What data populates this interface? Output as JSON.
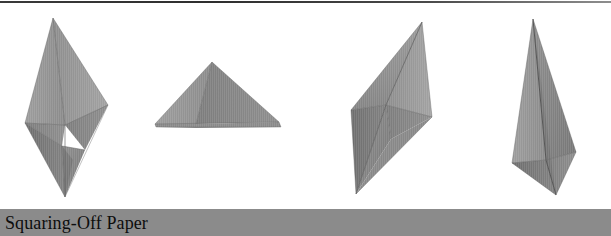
{
  "page": {
    "width": 611,
    "height": 236,
    "background_color": "#ffffff"
  },
  "top_rule": {
    "name": "top-rule",
    "color": "#2e2e2e"
  },
  "caption": {
    "text": "Squaring-Off Paper",
    "bar_color": "#8b8b8b",
    "text_color": "#0d0d0d"
  },
  "figures": {
    "label": "origami squaring-off paper sequence",
    "paper_colors": {
      "light": "#a7a7a7",
      "mid": "#949494",
      "dark": "#7e7e7e",
      "darker": "#6e6e6e",
      "shadow": "#5f5f5f",
      "edge": "#4a4a4a",
      "fold_line": "#5a5a5a"
    },
    "items": [
      {
        "index": 1,
        "name": "figure-vertical-diamond",
        "caption_role": "step-1",
        "description": "tall vertical double-kite, pointed top and bottom"
      },
      {
        "index": 2,
        "name": "figure-triangle",
        "caption_role": "step-2",
        "description": "wide low triangle, apex up, flat base"
      },
      {
        "index": 3,
        "name": "figure-tilted-rhombus",
        "caption_role": "step-3",
        "description": "tilted rhombus with diagonal fold crease"
      },
      {
        "index": 4,
        "name": "figure-narrow-dart",
        "caption_role": "step-4",
        "description": "narrow elongated dart with kite-shaped base"
      }
    ]
  }
}
